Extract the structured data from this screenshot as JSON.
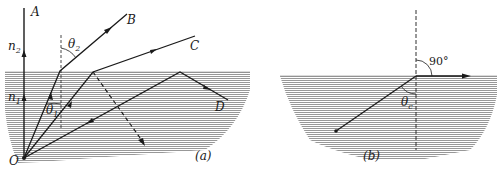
{
  "figure": {
    "panel_a": {
      "caption": "(a)",
      "labels": {
        "A": "A",
        "B": "B",
        "C": "C",
        "D": "D",
        "O": "O",
        "n2_base": "n",
        "n2_sub": "2",
        "n1_base": "n",
        "n1_sub": "1",
        "theta2_base": "θ",
        "theta2_sub": "2",
        "theta1_base": "θ",
        "theta1_sub": "1"
      }
    },
    "panel_b": {
      "caption": "(b)",
      "labels": {
        "right_angle": "90°",
        "thetac_base": "θ",
        "thetac_sub": "c"
      }
    },
    "colors": {
      "ink": "#1a1a1a",
      "water_hatch": "#8c8c8c",
      "background": "#ffffff"
    }
  }
}
